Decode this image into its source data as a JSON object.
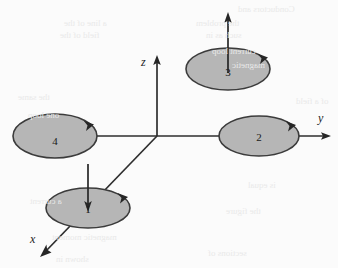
{
  "figure": {
    "background_color": "#fbfbfb",
    "loop_fill_color": "#b6b6b6",
    "loop_stroke_color": "#3b3b3b",
    "axis_color": "#2e2e2e"
  },
  "axes": [
    {
      "id": "x",
      "label": "x",
      "label_x": 30,
      "label_y": 243,
      "direction": "down-left",
      "tip_x": 40,
      "tip_y": 256
    },
    {
      "id": "y",
      "label": "y",
      "label_x": 318,
      "label_y": 122,
      "direction": "right",
      "tip_x": 331,
      "tip_y": 136
    },
    {
      "id": "z",
      "label": "z",
      "label_x": 141,
      "label_y": 66,
      "direction": "up",
      "tip_x": 157,
      "tip_y": 56
    }
  ],
  "origin": {
    "x": 157,
    "y": 136
  },
  "loops": [
    {
      "id": "loop-1",
      "label": "1",
      "cx": 88,
      "cy": 208,
      "rx": 42,
      "ry": 20,
      "label_x": 88,
      "label_y": 213,
      "circulation_arrow": "clockwise-right-rim",
      "field_arrow": {
        "direction": "down",
        "x": 88,
        "y_start": 165,
        "y_end": 212
      }
    },
    {
      "id": "loop-2",
      "label": "2",
      "cx": 259,
      "cy": 136,
      "rx": 40,
      "ry": 20,
      "label_x": 259,
      "label_y": 141,
      "circulation_arrow": "clockwise-right-rim",
      "field_arrow": null
    },
    {
      "id": "loop-3",
      "label": "3",
      "cx": 228,
      "cy": 69,
      "rx": 42,
      "ry": 21,
      "label_x": 228,
      "label_y": 76,
      "circulation_arrow": "clockwise-right-rim",
      "field_arrow": {
        "direction": "up",
        "x": 228,
        "y_start": 72,
        "y_end": 13
      }
    },
    {
      "id": "loop-4",
      "label": "4",
      "cx": 55,
      "cy": 136,
      "rx": 42,
      "ry": 22,
      "label_x": 55,
      "label_y": 145,
      "circulation_arrow": "clockwise-right-rim",
      "field_arrow": null
    }
  ],
  "bleed_through": [
    {
      "text": "Conductors and",
      "x": 238,
      "y": 4
    },
    {
      "text": "a line of the",
      "x": 64,
      "y": 18
    },
    {
      "text": "the problem",
      "x": 196,
      "y": 18
    },
    {
      "text": "field of the",
      "x": 60,
      "y": 30
    },
    {
      "text": "such as in",
      "x": 206,
      "y": 30
    },
    {
      "text": "current loop",
      "x": 212,
      "y": 46
    },
    {
      "text": "magnetic",
      "x": 232,
      "y": 60
    },
    {
      "text": "the same",
      "x": 18,
      "y": 92
    },
    {
      "text": "of a field",
      "x": 296,
      "y": 96
    },
    {
      "text": "one loop",
      "x": 28,
      "y": 110
    },
    {
      "text": "is equal",
      "x": 248,
      "y": 180
    },
    {
      "text": "a current",
      "x": 30,
      "y": 196
    },
    {
      "text": "the figure",
      "x": 226,
      "y": 206
    },
    {
      "text": "magnetic moment",
      "x": 52,
      "y": 232
    },
    {
      "text": "sections of",
      "x": 208,
      "y": 248
    },
    {
      "text": "shown in",
      "x": 56,
      "y": 254
    }
  ]
}
